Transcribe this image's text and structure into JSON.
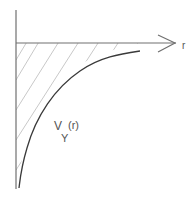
{
  "diagram": {
    "type": "potential-curve-sketch",
    "axis_label_horizontal": "r",
    "curve_label": {
      "main": "V",
      "subscript": "Y",
      "argument": "(r)"
    },
    "colors": {
      "axis": "#707070",
      "curve": "#3a3a3a",
      "hatch": "#c8c8c8",
      "label": "#555555"
    }
  }
}
